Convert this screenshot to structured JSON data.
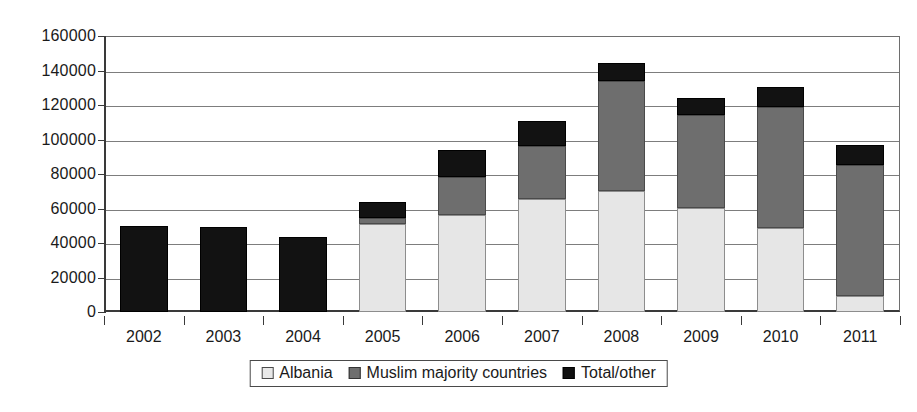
{
  "chart_data": {
    "type": "bar",
    "stacked": true,
    "title": "",
    "subtitle": "",
    "xlabel": "",
    "ylabel": "",
    "grid": true,
    "legend_position": "bottom",
    "categories": [
      "2002",
      "2003",
      "2004",
      "2005",
      "2006",
      "2007",
      "2008",
      "2009",
      "2010",
      "2011"
    ],
    "ylim": [
      0,
      160000
    ],
    "ytick_values": [
      0,
      20000,
      40000,
      60000,
      80000,
      100000,
      120000,
      140000,
      160000
    ],
    "ytick_labels": [
      "0",
      "20000",
      "40000",
      "60000",
      "80000",
      "100000",
      "120000",
      "140000",
      "160000"
    ],
    "series": [
      {
        "name": "Albania",
        "color": "#e6e6e6",
        "values": [
          0,
          0,
          0,
          51000,
          56500,
          65500,
          70000,
          60500,
          48500,
          9000
        ]
      },
      {
        "name": "Muslim majority countries",
        "color": "#6e6e6e",
        "values": [
          0,
          0,
          0,
          3500,
          21500,
          30500,
          64000,
          54000,
          70500,
          76000
        ]
      },
      {
        "name": "Total/other",
        "color": "#111111",
        "values": [
          50000,
          49500,
          43500,
          9500,
          16000,
          15000,
          10500,
          9500,
          11500,
          12000
        ]
      }
    ],
    "totals": [
      50000,
      49500,
      43500,
      64000,
      94000,
      111000,
      144500,
      124000,
      130500,
      97000
    ]
  }
}
